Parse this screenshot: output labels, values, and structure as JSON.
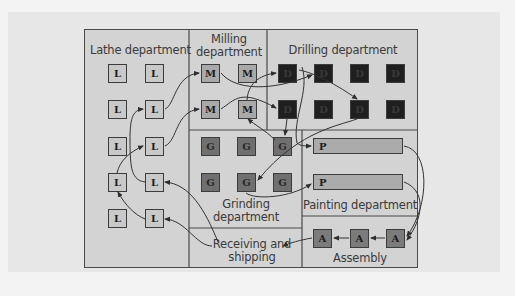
{
  "diagram": {
    "type": "process-layout-floor-plan",
    "departments": {
      "lathe": {
        "label": "Lathe department",
        "machine_letter": "L",
        "machine_count": 10
      },
      "milling": {
        "label_line1": "Milling",
        "label_line2": "department",
        "machine_letter": "M",
        "machine_count": 4
      },
      "drilling": {
        "label": "Drilling department",
        "machine_letter": "D",
        "machine_count": 8
      },
      "grinding": {
        "label_line1": "Grinding",
        "label_line2": "department",
        "machine_letter": "G",
        "machine_count": 6
      },
      "painting": {
        "label": "Painting department",
        "machine_letter": "P",
        "machine_count": 2
      },
      "receiving": {
        "label_line1": "Receiving and",
        "label_line2": "shipping"
      },
      "assembly": {
        "label": "Assembly",
        "machine_letter": "A",
        "machine_count": 3
      }
    },
    "flow_description": [
      "Receiving and shipping -> Lathe",
      "Lathe -> Milling",
      "Milling -> Drilling",
      "Drilling -> Grinding",
      "Grinding -> Painting",
      "Drilling -> Painting",
      "Painting -> Assembly",
      "Assembly -> Receiving and shipping"
    ],
    "colors": {
      "frame_fill": "#d3d3d3",
      "lathe_box": "#c9c9c9",
      "milling_box": "#a9a9a9",
      "drilling_box": "#1f1f1f",
      "grinding_box": "#707070",
      "painting_bar": "#ababab",
      "assembly_box": "#7b7b7b",
      "lines": "#3c3c3c"
    }
  }
}
